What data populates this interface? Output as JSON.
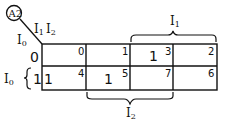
{
  "map": {
    "id_label": "A2",
    "column_variables": "I1I2",
    "column_var_1": "I",
    "column_var_1_sub": "1",
    "column_var_2": "I",
    "column_var_2_sub": "2",
    "row_variable": "I",
    "row_variable_sub": "0",
    "row_labels": [
      "0",
      "1"
    ],
    "row_brace_label": "I",
    "row_brace_sub": "0",
    "top_brace_label": "I",
    "top_brace_sub": "1",
    "bottom_brace_label": "I",
    "bottom_brace_sub": "2",
    "cells": [
      [
        {
          "index": "0",
          "value": ""
        },
        {
          "index": "1",
          "value": ""
        },
        {
          "index": "3",
          "value": "1"
        },
        {
          "index": "2",
          "value": ""
        }
      ],
      [
        {
          "index": "4",
          "value": "1"
        },
        {
          "index": "5",
          "value": "1"
        },
        {
          "index": "7",
          "value": ""
        },
        {
          "index": "6",
          "value": ""
        }
      ]
    ]
  }
}
